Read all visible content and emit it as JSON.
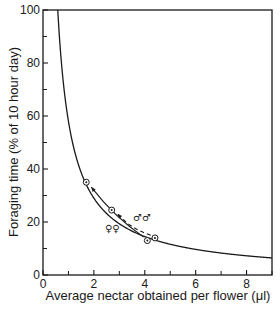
{
  "chart_data": {
    "type": "line",
    "title": "",
    "xlabel": "Average nectar obtained per flower (μl)",
    "ylabel": "Foraging time (% of 10 hour day)",
    "xlim": [
      0,
      9
    ],
    "ylim": [
      0,
      100
    ],
    "x_ticks": [
      0,
      2,
      4,
      6,
      8
    ],
    "x_minor_ticks": [
      1,
      3,
      5,
      7,
      9
    ],
    "y_ticks": [
      0,
      20,
      40,
      60,
      80,
      100
    ],
    "y_minor_ticks": [
      10,
      30,
      50,
      70,
      90
    ],
    "grid": false,
    "legend": null,
    "series": [
      {
        "name": "predicted curve",
        "style": "solid",
        "equation": "y = 58 / x",
        "x": [
          0.58,
          1,
          1.5,
          2,
          2.5,
          3,
          4,
          5,
          6,
          7,
          8,
          9
        ],
        "values": [
          100,
          58,
          38.7,
          29,
          23.2,
          19.3,
          14.5,
          11.6,
          9.7,
          8.3,
          7.3,
          6.5
        ]
      },
      {
        "name": "females (♀♀)",
        "style": "solid-arrow",
        "x": [
          4.1,
          1.7
        ],
        "values": [
          13,
          35
        ]
      },
      {
        "name": "males (♂♂)",
        "style": "dashed-arrow",
        "x": [
          4.4,
          2.7
        ],
        "values": [
          14,
          24.5
        ]
      }
    ],
    "points": [
      {
        "x": 1.7,
        "y": 35,
        "marker": "circled-dot"
      },
      {
        "x": 2.7,
        "y": 24.5,
        "marker": "circled-dot"
      },
      {
        "x": 4.1,
        "y": 13,
        "marker": "circled-dot"
      },
      {
        "x": 4.4,
        "y": 14,
        "marker": "circled-dot"
      }
    ],
    "annotations": [
      {
        "text": "♂♂",
        "x": 3.5,
        "y": 22
      },
      {
        "text": "♀♀",
        "x": 2.9,
        "y": 17
      }
    ]
  },
  "labels": {
    "xlabel": "Average nectar obtained per flower (μl)",
    "ylabel": "Foraging time (% of 10 hour day)",
    "males": "♂♂",
    "females": "♀♀",
    "xticks": [
      "0",
      "2",
      "4",
      "6",
      "8"
    ],
    "yticks": [
      "0",
      "20",
      "40",
      "60",
      "80",
      "100"
    ]
  }
}
